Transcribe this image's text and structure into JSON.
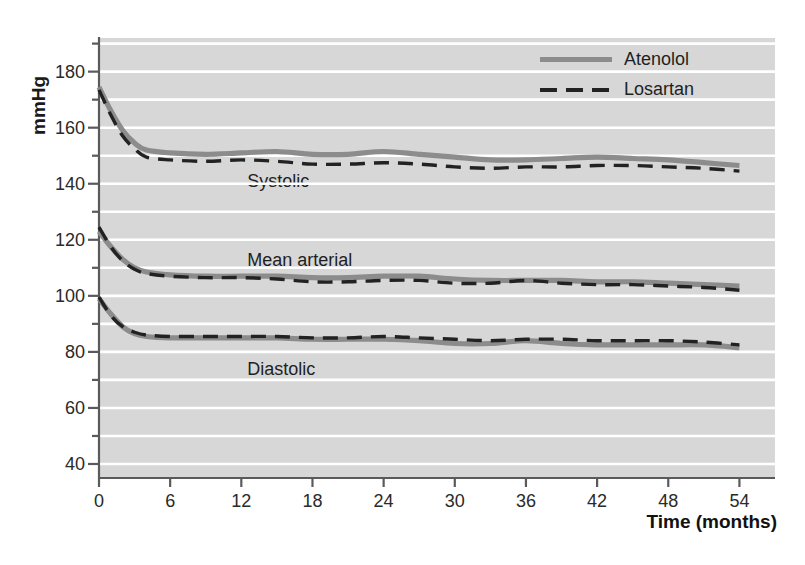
{
  "chart_data": {
    "type": "line",
    "title": "",
    "xlabel": "Time (months)",
    "ylabel": "mmHg",
    "xlim": [
      0,
      57
    ],
    "ylim": [
      35,
      192
    ],
    "grid": true,
    "grid_interval": 10,
    "legend_position": "top-right",
    "x_ticks": [
      0,
      6,
      12,
      18,
      24,
      30,
      36,
      42,
      48,
      54
    ],
    "x_tick_labels": [
      "0",
      "6",
      "12",
      "18",
      "24",
      "30",
      "36",
      "42",
      "48",
      "54"
    ],
    "y_ticks": [
      40,
      60,
      80,
      100,
      120,
      140,
      160,
      180
    ],
    "y_tick_labels": [
      "40",
      "60",
      "80",
      "100",
      "120",
      "140",
      "160",
      "180"
    ],
    "y_minor_ticks": [
      50,
      70,
      90,
      110,
      130,
      150,
      170,
      190
    ],
    "legend": [
      {
        "name": "Atenolol",
        "style": "solid",
        "color": "#8c8c8c"
      },
      {
        "name": "Losartan",
        "style": "dashed",
        "color": "#222222"
      }
    ],
    "annotations": [
      {
        "text": "Systolic",
        "x": 12.5,
        "y": 140.5
      },
      {
        "text": "Mean arterial",
        "x": 12.5,
        "y": 112.5
      },
      {
        "text": "Diastolic",
        "x": 12.5,
        "y": 73.5
      }
    ],
    "x": [
      0,
      1,
      2,
      3,
      4,
      6,
      9,
      12,
      15,
      18,
      21,
      24,
      27,
      30,
      33,
      36,
      39,
      42,
      45,
      48,
      51,
      54
    ],
    "series": [
      {
        "name": "Atenolol",
        "measure": "Systolic",
        "style": "solid",
        "color": "#8c8c8c",
        "values": [
          174.5,
          166.0,
          159.0,
          154.5,
          152.0,
          151.0,
          150.5,
          151.0,
          151.5,
          150.5,
          150.5,
          151.5,
          150.5,
          149.5,
          148.5,
          148.5,
          149.0,
          149.5,
          149.0,
          148.5,
          147.5,
          146.5
        ]
      },
      {
        "name": "Losartan",
        "measure": "Systolic",
        "style": "dashed",
        "color": "#222222",
        "values": [
          173.5,
          164.5,
          157.0,
          152.5,
          149.5,
          148.5,
          148.0,
          148.5,
          148.0,
          147.0,
          147.0,
          147.5,
          147.0,
          146.0,
          145.5,
          146.0,
          146.0,
          146.5,
          146.5,
          146.0,
          145.5,
          144.5
        ]
      },
      {
        "name": "Atenolol",
        "measure": "Mean arterial",
        "style": "solid",
        "color": "#8c8c8c",
        "values": [
          123.0,
          117.5,
          113.0,
          110.0,
          108.5,
          107.5,
          107.0,
          107.0,
          107.0,
          106.5,
          106.5,
          107.0,
          107.0,
          106.0,
          105.5,
          105.5,
          105.5,
          105.0,
          105.0,
          104.5,
          104.0,
          103.5
        ]
      },
      {
        "name": "Losartan",
        "measure": "Mean arterial",
        "style": "dashed",
        "color": "#222222",
        "values": [
          124.5,
          117.5,
          112.5,
          109.5,
          108.0,
          107.0,
          106.5,
          106.5,
          106.0,
          105.0,
          105.0,
          105.5,
          105.5,
          104.5,
          104.5,
          105.5,
          104.5,
          104.0,
          104.0,
          103.5,
          103.0,
          102.0
        ]
      },
      {
        "name": "Atenolol",
        "measure": "Diastolic",
        "style": "solid",
        "color": "#8c8c8c",
        "values": [
          99.0,
          93.5,
          89.0,
          86.5,
          85.5,
          85.0,
          85.0,
          85.0,
          85.0,
          84.5,
          84.5,
          84.5,
          84.0,
          83.0,
          83.0,
          84.0,
          83.0,
          82.5,
          82.5,
          82.5,
          82.5,
          81.5
        ]
      },
      {
        "name": "Losartan",
        "measure": "Diastolic",
        "style": "dashed",
        "color": "#222222",
        "values": [
          99.5,
          93.0,
          89.0,
          87.0,
          86.0,
          85.5,
          85.5,
          85.5,
          85.5,
          85.0,
          85.0,
          85.5,
          85.0,
          84.5,
          84.0,
          84.5,
          84.5,
          84.0,
          84.0,
          84.0,
          83.5,
          82.5
        ]
      }
    ]
  },
  "axes": {
    "y_title": "mmHg",
    "x_title": "Time (months)"
  }
}
